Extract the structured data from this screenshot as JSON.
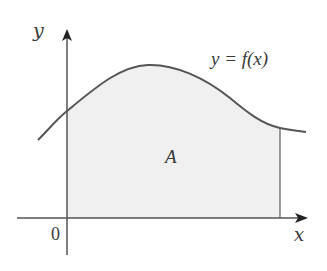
{
  "figure": {
    "type": "area-under-curve",
    "function_label": "y = f(x)",
    "area_label": "A",
    "axes": {
      "x_label": "x",
      "y_label": "y",
      "origin_label": "0"
    },
    "colors": {
      "curve": "#555555",
      "axes": "#555555",
      "fill": "#f0f0f0",
      "text": "#3a3a3a"
    }
  }
}
